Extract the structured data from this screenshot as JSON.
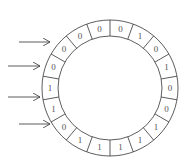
{
  "diagram": {
    "type": "circular-buffer",
    "center": [
      110,
      88
    ],
    "outer_radius": 68,
    "inner_radius": 52,
    "segment_count": 18,
    "start_angle_deg": 0,
    "direction": "clockwise",
    "stroke_color": "#333333",
    "text_color": "#555555",
    "segments": [
      "0",
      "1",
      "0",
      "1",
      "0",
      "0",
      "1",
      "1",
      "1",
      "1",
      "1",
      "0",
      "1",
      "1",
      "0",
      "0",
      "0",
      "0"
    ],
    "arrows": [
      {
        "x1": 19,
        "y1": 42,
        "x2": 50,
        "y2": 42
      },
      {
        "x1": 8,
        "y1": 66,
        "x2": 40,
        "y2": 66
      },
      {
        "x1": 8,
        "y1": 97,
        "x2": 40,
        "y2": 97
      },
      {
        "x1": 19,
        "y1": 124,
        "x2": 50,
        "y2": 124
      }
    ]
  }
}
